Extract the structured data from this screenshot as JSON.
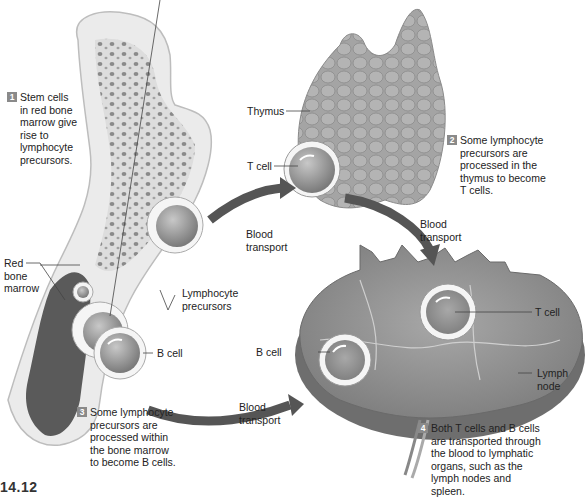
{
  "figure": {
    "number": "14.12",
    "type": "textbook illustration",
    "color_mode": "grayscale"
  },
  "steps": [
    {
      "number": "1",
      "text": "Stem cells\nin red bone\nmarrow give\nrise to\nlymphocyte\nprecursors."
    },
    {
      "number": "2",
      "text": "Some lymphocyte\nprecursors are\nprocessed in the\nthymus to become\nT cells."
    },
    {
      "number": "3",
      "text": "Some lymphocyte\nprecursors are\nprocessed within\nthe bone marrow\nto become B cells."
    },
    {
      "number": "4",
      "text": "Both T cells and B cells\nare transported through\nthe blood to lymphatic\norgans, such as the\nlymph nodes and\nspleen."
    }
  ],
  "labels": {
    "thymus": "Thymus",
    "t_cell_thymus": "T cell",
    "red_bone_marrow": "Red\nbone\nmarrow",
    "lymphocyte_precursors": "Lymphocyte\nprecursors",
    "b_cell_bone": "B cell",
    "blood_transport_1": "Blood\ntransport",
    "blood_transport_2": "Blood\ntransport",
    "blood_transport_3": "Blood\ntransport",
    "b_cell_node": "B cell",
    "t_cell_node": "T cell",
    "lymph_node": "Lymph\nnode"
  },
  "colors": {
    "background": "#ffffff",
    "bone": "#e9e9e9",
    "marrow": "#5a5a5a",
    "tissue": "#9a9a9a",
    "arrow": "#555555",
    "step_badge": "#8a8a8a",
    "text": "#222222"
  }
}
